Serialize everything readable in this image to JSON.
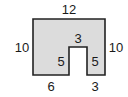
{
  "diagram": {
    "type": "composite-rectilinear-figure",
    "shape": {
      "fill": "#dcdcdc",
      "stroke": "#222222",
      "points": "33,19 105,19 105,75 87,75 87,47 69,47 69,75 33,75"
    },
    "labels": {
      "top": "12",
      "left": "10",
      "right": "10",
      "notch_top": "3",
      "notch_left": "5",
      "notch_right": "5",
      "bottom_left": "6",
      "bottom_right": "3"
    }
  }
}
